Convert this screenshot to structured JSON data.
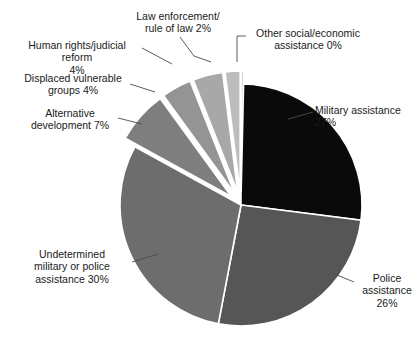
{
  "chart_data": {
    "type": "pie",
    "title": "",
    "subtitle": "",
    "xlabel": "",
    "ylabel": "",
    "legend_position": "none",
    "grid": false,
    "units": "percent",
    "total": 100,
    "categories": [
      "Military assistance",
      "Police assistance",
      "Undetermined military or police assistance",
      "Alternative development",
      "Displaced vulnerable groups",
      "Human rights/judicial reform",
      "Law enforcement/rule of law",
      "Other social/economic assistance"
    ],
    "values": [
      27,
      26,
      30,
      7,
      4,
      4,
      2,
      0
    ],
    "slices": [
      {
        "name": "Military assistance",
        "value": 27,
        "value_label": "27%",
        "label_lines": "Military assistance\n27%",
        "color": "#0a0a0a",
        "exploded": false,
        "start_angle": 0,
        "end_angle": 97.2
      },
      {
        "name": "Police assistance",
        "value": 26,
        "value_label": "26%",
        "label_lines": "Police\nassistance\n26%",
        "color": "#565656",
        "exploded": false,
        "start_angle": 97.2,
        "end_angle": 190.8
      },
      {
        "name": "Undetermined military or police assistance",
        "value": 30,
        "value_label": "30%",
        "label_lines": "Undetermined\nmilitary or police\nassistance 30%",
        "color": "#6d6d6d",
        "exploded": false,
        "start_angle": 190.8,
        "end_angle": 298.8
      },
      {
        "name": "Alternative development",
        "value": 7,
        "value_label": "7%",
        "label_lines": "Alternative\ndevelopment 7%",
        "color": "#7e7e7e",
        "exploded": true,
        "start_angle": 298.8,
        "end_angle": 324.0
      },
      {
        "name": "Displaced vulnerable groups",
        "value": 4,
        "value_label": "4%",
        "label_lines": "Displaced vulnerable\ngroups 4%",
        "color": "#949494",
        "exploded": true,
        "start_angle": 324.0,
        "end_angle": 338.4
      },
      {
        "name": "Human rights/judicial reform",
        "value": 4,
        "value_label": "4%",
        "label_lines": "Human rights/judicial reform\n4%",
        "color": "#a8a8a8",
        "exploded": true,
        "start_angle": 338.4,
        "end_angle": 352.8
      },
      {
        "name": "Law enforcement/rule of law",
        "value": 2,
        "value_label": "2%",
        "label_lines": "Law enforcement/\nrule of law 2%",
        "color": "#bdbdbd",
        "exploded": true,
        "start_angle": 352.8,
        "end_angle": 360.0
      },
      {
        "name": "Other social/economic assistance",
        "value": 0,
        "value_label": "0%",
        "label_lines": "Other social/economic\nassistance 0%",
        "color": "#d2d2d2",
        "exploded": true,
        "start_angle": 360.0,
        "end_angle": 361.3
      }
    ],
    "geometry": {
      "center_x": 241,
      "center_y": 205,
      "radius": 121,
      "explode_offset": 13,
      "rotation_deg": 0
    },
    "style": {
      "slice_border_color": "#ffffff",
      "slice_border_width": 1.6,
      "leader_line_color": "#4a4a4a",
      "text_color": "#1a1a1a",
      "background": "#ffffff"
    }
  }
}
